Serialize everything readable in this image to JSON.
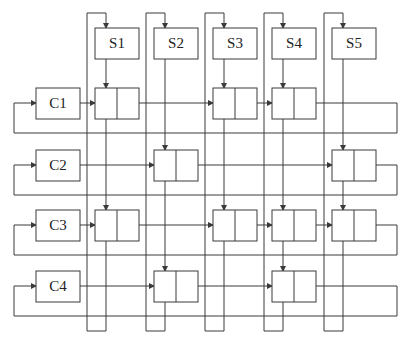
{
  "diagram": {
    "type": "orthogonal-linked-list",
    "columns": [
      {
        "id": "S1",
        "label": "S1"
      },
      {
        "id": "S2",
        "label": "S2"
      },
      {
        "id": "S3",
        "label": "S3"
      },
      {
        "id": "S4",
        "label": "S4"
      },
      {
        "id": "S5",
        "label": "S5"
      }
    ],
    "rows": [
      {
        "id": "C1",
        "label": "C1",
        "cells": [
          "S1",
          "S3",
          "S4"
        ]
      },
      {
        "id": "C2",
        "label": "C2",
        "cells": [
          "S2",
          "S5"
        ]
      },
      {
        "id": "C3",
        "label": "C3",
        "cells": [
          "S1",
          "S3",
          "S4",
          "S5"
        ]
      },
      {
        "id": "C4",
        "label": "C4",
        "cells": [
          "S2",
          "S4"
        ]
      }
    ],
    "colors": {
      "line": "#3a3a3a",
      "background": "#ffffff"
    }
  }
}
